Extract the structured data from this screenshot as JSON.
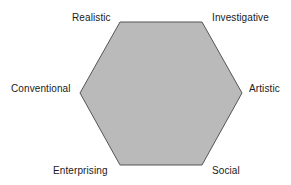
{
  "diagram": {
    "shape": "hexagon",
    "fill_color": "#bababa",
    "stroke_color": "#555555",
    "vertices": {
      "top_left": "Realistic",
      "top_right": "Investigative",
      "right": "Artistic",
      "bottom_right": "Social",
      "bottom_left": "Enterprising",
      "left": "Conventional"
    },
    "labels": {
      "realistic": "Realistic",
      "investigative": "Investigative",
      "artistic": "Artistic",
      "social": "Social",
      "enterprising": "Enterprising",
      "conventional": "Conventional"
    }
  }
}
